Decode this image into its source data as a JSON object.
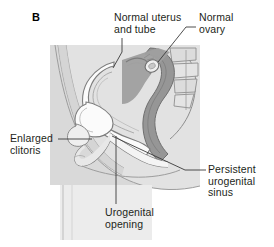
{
  "figure": {
    "panel_letter": "B",
    "type": "medical-illustration",
    "view": "sagittal section of female pelvis",
    "palette": {
      "background": "#ffffff",
      "plate_background": "#d9d9d9",
      "body_light": "#e9e9e9",
      "body_mid": "#cfcfcf",
      "organ_dark": "#9a9a9a",
      "organ_darker": "#848484",
      "outline": "#6f6f6f",
      "cavity_white": "#fbfbfb",
      "text": "#231f20",
      "leader_line": "#3a3a3a"
    },
    "labels": [
      {
        "id": "normal-uterus-and-tube",
        "text": "Normal uterus\nand tube",
        "anchor": "top-center",
        "leader": "vertical then angled to uterus body"
      },
      {
        "id": "normal-ovary",
        "text": "Normal\novary",
        "anchor": "top-right",
        "leader": "horizontal dash then diagonal to ovary"
      },
      {
        "id": "enlarged-clitoris",
        "text": "Enlarged\nclitoris",
        "anchor": "left",
        "leader": "horizontal to clitoral region"
      },
      {
        "id": "persistent-urogenital-sinus",
        "text": "Persistent\nurogenital\nsinus",
        "anchor": "right",
        "leader": "horizontal then diagonal up-left to sinus"
      },
      {
        "id": "urogenital-opening",
        "text": "Urogenital\nopening",
        "anchor": "bottom-center",
        "leader": "vertical up to the opening"
      }
    ]
  }
}
